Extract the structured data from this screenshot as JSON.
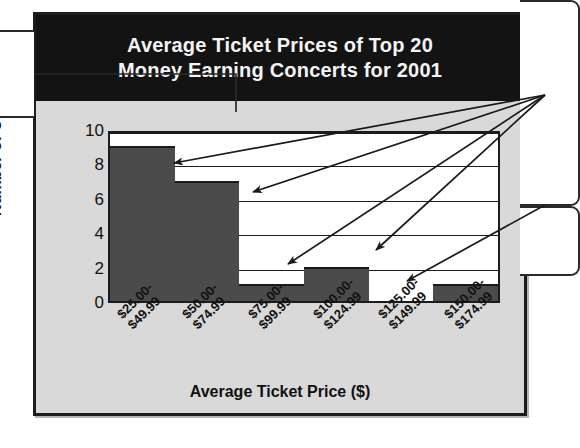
{
  "figure": {
    "title_line1": "Average Ticket Prices of Top 20",
    "title_line2": "Money Earning Concerts for 2001",
    "background_color": "#d9d9d9",
    "banner_color": "#131313",
    "plot_background": "#ffffff",
    "bar_color": "#4b4b4b",
    "line_color": "#1c1c1c"
  },
  "chart_data": {
    "type": "bar",
    "title": "Average Ticket Prices of Top 20 Money Earning Concerts for 2001",
    "categories": [
      "$25.00–$49.99",
      "$50.00–$74.99",
      "$75.00–$99.99",
      "$100.00–$124.99",
      "$125.00–$149.99",
      "$150.00–$174.99"
    ],
    "category_lines": [
      [
        "$25.00-",
        "$49.99"
      ],
      [
        "$50.00-",
        "$74.99"
      ],
      [
        "$75.00-",
        "$99.99"
      ],
      [
        "$100.00-",
        "$124.99"
      ],
      [
        "$125.00-",
        "$149.99"
      ],
      [
        "$150.00-",
        "$174.99"
      ]
    ],
    "values": [
      9,
      7,
      1,
      2,
      0,
      1
    ],
    "xlabel": "Average Ticket Price ($)",
    "ylabel": "Number of Concerts",
    "ylim": [
      0,
      10
    ],
    "yticks": [
      0,
      2,
      4,
      6,
      8,
      10
    ],
    "ytick_labels": [
      "0",
      "2",
      "4",
      "6",
      "8",
      "10"
    ],
    "grid": true,
    "grid_axis": "y",
    "legend": false,
    "total_concerts": 20
  },
  "annotations": {
    "arrow_count": 5,
    "description": "Five leader arrows drawn from right-side callout boxes pointing to the tops of the plotted bars"
  }
}
